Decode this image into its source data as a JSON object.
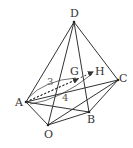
{
  "figure": {
    "type": "geometry",
    "points": {
      "D": {
        "label": "D",
        "x": 74,
        "y": 22
      },
      "A": {
        "label": "A",
        "x": 26,
        "y": 102
      },
      "O": {
        "label": "O",
        "x": 48,
        "y": 125
      },
      "B": {
        "label": "B",
        "x": 89,
        "y": 112
      },
      "C": {
        "label": "C",
        "x": 118,
        "y": 80
      },
      "G": {
        "label": "G",
        "x": 78,
        "y": 79
      },
      "H": {
        "label": "H",
        "x": 93,
        "y": 72
      }
    },
    "annotations": {
      "ratio_upper": "3",
      "ratio_lower": "4"
    },
    "colors": {
      "stroke": "#333333",
      "background": "#ffffff"
    }
  }
}
